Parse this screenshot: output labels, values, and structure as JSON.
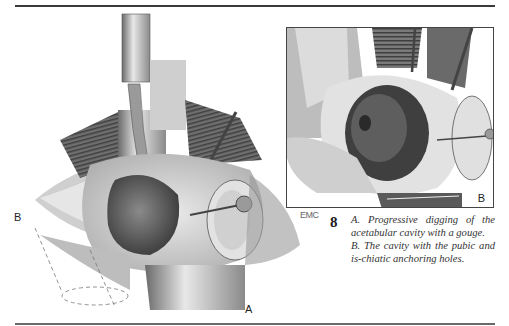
{
  "figure": {
    "number": "8",
    "panels": {
      "a": {
        "label": "A",
        "description": "Illustration of the acetabular cavity being dug with a gouge, with retractors and anchoring pin"
      },
      "b_left_label": "B",
      "b": {
        "label": "B",
        "description": "Inset illustration of the completed cavity with pubic and ischiatic anchoring holes"
      }
    },
    "signature": "EMC",
    "caption": {
      "a": "A. Progressive digging of the acetabular cavity with a gouge.",
      "b": "B. The cavity with the pubic and is-chiatic anchoring holes."
    }
  },
  "colors": {
    "rule": "#3a3a3a",
    "text": "#333333",
    "illustration_dark": "#3c3c3c",
    "illustration_mid": "#8a8a8a",
    "illustration_light": "#d8d8d8"
  }
}
